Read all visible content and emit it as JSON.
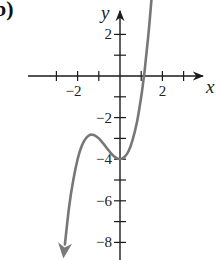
{
  "panel": {
    "label": "b)"
  },
  "chart_data": {
    "type": "line",
    "title": "",
    "xlabel": "x",
    "ylabel": "y",
    "xlim": [
      -3,
      3.8
    ],
    "ylim": [
      -8.8,
      3.1
    ],
    "grid": false,
    "legend": null,
    "x_ticks": [
      -3,
      -2,
      -1,
      1,
      2,
      3
    ],
    "x_tick_labels": [
      {
        "value": -2,
        "text": "−2"
      },
      {
        "value": 2,
        "text": "2"
      }
    ],
    "y_ticks": [
      2,
      1,
      -1,
      -2,
      -3,
      -4,
      -5,
      -6,
      -7,
      -8
    ],
    "y_tick_labels": [
      {
        "value": 2,
        "text": "2"
      },
      {
        "value": -2,
        "text": "−2"
      },
      {
        "value": -4,
        "text": "−4"
      },
      {
        "value": -6,
        "text": "−6"
      },
      {
        "value": -8,
        "text": "−8"
      }
    ],
    "series": [
      {
        "name": "f(x)",
        "description": "cubic curve with local max near (-1.33, -2.8), local min at (0, -4), x-intercept near 1.13; arrows at both ends",
        "color": "#777777",
        "x": [
          -2.6,
          -2.4,
          -2.2,
          -2.0,
          -1.8,
          -1.6,
          -1.4,
          -1.33,
          -1.2,
          -1.0,
          -0.8,
          -0.6,
          -0.4,
          -0.2,
          0.0,
          0.2,
          0.4,
          0.6,
          0.8,
          1.0,
          1.13,
          1.2,
          1.4,
          1.6,
          1.75
        ],
        "y": [
          -8.1,
          -6.3,
          -4.98,
          -4.0,
          -3.35,
          -2.98,
          -2.82,
          -2.82,
          -2.85,
          -3.0,
          -3.23,
          -3.5,
          -3.74,
          -3.93,
          -4.0,
          -3.91,
          -3.62,
          -3.06,
          -2.21,
          -1.0,
          0.0,
          0.61,
          2.66,
          5.22,
          7.49
        ]
      }
    ],
    "arrows": {
      "curve_start": "down-left",
      "curve_end": "up-right",
      "x_axis": "right",
      "y_axis": "up"
    }
  },
  "colors": {
    "axis": "#1a1a1a",
    "curve": "#7a7a7a",
    "text": "#222222"
  }
}
